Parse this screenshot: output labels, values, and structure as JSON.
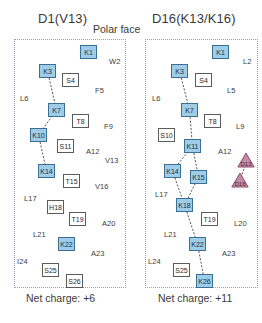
{
  "figure": {
    "center_label": "Polar face",
    "panels": [
      {
        "id": "left",
        "title": "D1(V13)",
        "net_charge_label": "Net charge: +6",
        "residues": [
          {
            "name": "K1",
            "type": "square-blue",
            "x": 80,
            "y": 45
          },
          {
            "name": "W2",
            "type": "plain",
            "x": 109,
            "y": 58
          },
          {
            "name": "K3",
            "type": "square-blue",
            "x": 39,
            "y": 64
          },
          {
            "name": "S4",
            "type": "square-white",
            "x": 62,
            "y": 73
          },
          {
            "name": "F5",
            "type": "plain",
            "x": 95,
            "y": 87
          },
          {
            "name": "L6",
            "type": "plain",
            "x": 20,
            "y": 95
          },
          {
            "name": "K7",
            "type": "square-blue",
            "x": 48,
            "y": 103
          },
          {
            "name": "T8",
            "type": "square-white",
            "x": 72,
            "y": 114
          },
          {
            "name": "F9",
            "type": "plain",
            "x": 104,
            "y": 123
          },
          {
            "name": "K10",
            "type": "square-blue",
            "x": 30,
            "y": 128
          },
          {
            "name": "S11",
            "type": "square-white",
            "x": 57,
            "y": 139
          },
          {
            "name": "A12",
            "type": "plain",
            "x": 86,
            "y": 148
          },
          {
            "name": "V13",
            "type": "plain",
            "x": 105,
            "y": 157
          },
          {
            "name": "K14",
            "type": "square-blue",
            "x": 38,
            "y": 164
          },
          {
            "name": "T15",
            "type": "square-white",
            "x": 63,
            "y": 174
          },
          {
            "name": "V16",
            "type": "plain",
            "x": 95,
            "y": 183
          },
          {
            "name": "L17",
            "type": "plain",
            "x": 24,
            "y": 195
          },
          {
            "name": "H18",
            "type": "square-white",
            "x": 47,
            "y": 200
          },
          {
            "name": "T19",
            "type": "square-white",
            "x": 69,
            "y": 212
          },
          {
            "name": "A20",
            "type": "plain",
            "x": 102,
            "y": 220
          },
          {
            "name": "L21",
            "type": "plain",
            "x": 33,
            "y": 231
          },
          {
            "name": "K22",
            "type": "square-blue",
            "x": 58,
            "y": 237
          },
          {
            "name": "A23",
            "type": "plain",
            "x": 91,
            "y": 250
          },
          {
            "name": "I24",
            "type": "plain",
            "x": 17,
            "y": 258
          },
          {
            "name": "S25",
            "type": "square-white",
            "x": 42,
            "y": 263
          },
          {
            "name": "S26",
            "type": "square-white",
            "x": 66,
            "y": 274
          }
        ],
        "connections": [
          [
            "K3",
            "K7"
          ],
          [
            "K7",
            "K10"
          ],
          [
            "K10",
            "K14"
          ]
        ]
      },
      {
        "id": "right",
        "title": "D16(K13/K16)",
        "net_charge_label": "Net charge: +11",
        "residues": [
          {
            "name": "K1",
            "type": "square-blue",
            "x": 212,
            "y": 45
          },
          {
            "name": "L2",
            "type": "plain",
            "x": 243,
            "y": 58
          },
          {
            "name": "K3",
            "type": "square-blue",
            "x": 171,
            "y": 64
          },
          {
            "name": "S4",
            "type": "square-white",
            "x": 195,
            "y": 73
          },
          {
            "name": "L5",
            "type": "plain",
            "x": 227,
            "y": 87
          },
          {
            "name": "L6",
            "type": "plain",
            "x": 152,
            "y": 95
          },
          {
            "name": "K7",
            "type": "square-blue",
            "x": 181,
            "y": 103
          },
          {
            "name": "T8",
            "type": "square-white",
            "x": 204,
            "y": 114
          },
          {
            "name": "L9",
            "type": "plain",
            "x": 236,
            "y": 123
          },
          {
            "name": "S10",
            "type": "square-white",
            "x": 158,
            "y": 128
          },
          {
            "name": "K11",
            "type": "square-blue",
            "x": 184,
            "y": 139
          },
          {
            "name": "A12",
            "type": "plain",
            "x": 218,
            "y": 148
          },
          {
            "name": "D13",
            "type": "triangle",
            "x": 237,
            "y": 152
          },
          {
            "name": "K14",
            "type": "square-blue",
            "x": 164,
            "y": 164
          },
          {
            "name": "K15",
            "type": "square-blue",
            "x": 190,
            "y": 170
          },
          {
            "name": "D16",
            "type": "triangle",
            "x": 231,
            "y": 172
          },
          {
            "name": "L17",
            "type": "plain",
            "x": 155,
            "y": 191
          },
          {
            "name": "K18",
            "type": "square-blue",
            "x": 176,
            "y": 198
          },
          {
            "name": "T19",
            "type": "square-white",
            "x": 201,
            "y": 212
          },
          {
            "name": "L20",
            "type": "plain",
            "x": 234,
            "y": 220
          },
          {
            "name": "L21",
            "type": "plain",
            "x": 164,
            "y": 231
          },
          {
            "name": "K22",
            "type": "square-blue",
            "x": 189,
            "y": 237
          },
          {
            "name": "A23",
            "type": "plain",
            "x": 222,
            "y": 250
          },
          {
            "name": "L24",
            "type": "plain",
            "x": 148,
            "y": 258
          },
          {
            "name": "S25",
            "type": "square-white",
            "x": 173,
            "y": 263
          },
          {
            "name": "K26",
            "type": "square-blue",
            "x": 196,
            "y": 274
          }
        ],
        "connections": [
          [
            "K3",
            "K7"
          ],
          [
            "K7",
            "K11"
          ],
          [
            "K11",
            "K14"
          ],
          [
            "K11",
            "K15"
          ],
          [
            "K14",
            "K18"
          ],
          [
            "K15",
            "K18"
          ],
          [
            "K18",
            "K22"
          ],
          [
            "K22",
            "K26"
          ],
          [
            "D13",
            "D16"
          ]
        ]
      }
    ]
  },
  "colors": {
    "basic_fill": "#9fcde8",
    "basic_stroke": "#3a6f96",
    "acidic_fill": "#c48ba8",
    "acidic_stroke": "#8c4f6e",
    "neutral_fill": "#ffffff",
    "neutral_stroke": "#5b5b5b",
    "panel_border": "#8fa2c0",
    "connector": "#555555",
    "text": "#2b2b2b"
  }
}
